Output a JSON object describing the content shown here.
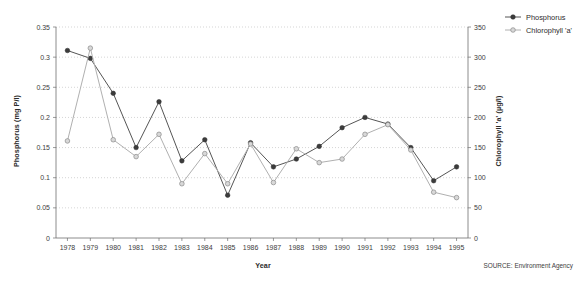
{
  "chart_data": {
    "type": "line",
    "title": "",
    "xlabel": "Year",
    "ylabel": "Phosphorus (mg P/l)",
    "y2label": "Chlorophyll 'a' (µg/l)",
    "categories": [
      "1978",
      "1979",
      "1980",
      "1981",
      "1982",
      "1983",
      "1984",
      "1985",
      "1986",
      "1987",
      "1988",
      "1989",
      "1990",
      "1991",
      "1992",
      "1993",
      "1994",
      "1995"
    ],
    "ylim": [
      0,
      0.35
    ],
    "y2lim": [
      0,
      350
    ],
    "yticks": [
      "0",
      "0.05",
      "0.1",
      "0.15",
      "0.2",
      "0.25",
      "0.3",
      "0.35"
    ],
    "ytick_values": [
      0,
      0.05,
      0.1,
      0.15,
      0.2,
      0.25,
      0.3,
      0.35
    ],
    "y2ticks": [
      "0",
      "50",
      "100",
      "150",
      "200",
      "250",
      "300",
      "350"
    ],
    "y2tick_values": [
      0,
      50,
      100,
      150,
      200,
      250,
      300,
      350
    ],
    "grid": true,
    "legend_position": "top-right",
    "series": [
      {
        "name": "Phosphorus",
        "axis": "left",
        "unit": "mg P/l",
        "marker": "filled-circle",
        "color": "#3c3c3c",
        "values": [
          0.311,
          0.298,
          0.24,
          0.15,
          0.226,
          0.128,
          0.163,
          0.071,
          0.158,
          0.118,
          0.131,
          0.152,
          0.183,
          0.2,
          0.189,
          0.15,
          0.095,
          0.118
        ]
      },
      {
        "name": "Chlorophyll 'a'",
        "axis": "right",
        "unit": "µg/l",
        "marker": "open-circle",
        "color": "#b0b0b0",
        "values": [
          161,
          315,
          163,
          135,
          172,
          90,
          140,
          90,
          156,
          92,
          148,
          125,
          131,
          172,
          188,
          146,
          76,
          67
        ]
      }
    ],
    "source": "SOURCE: Environment Agency"
  },
  "legend": {
    "items": [
      {
        "label": "Phosphorus"
      },
      {
        "label": "Chlorophyll 'a'"
      }
    ]
  }
}
